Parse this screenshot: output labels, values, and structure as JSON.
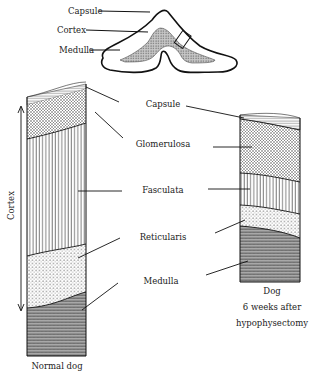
{
  "inset": {
    "labels": {
      "capsule": "Capsule",
      "cortex": "Cortex",
      "medulla": "Medulla"
    }
  },
  "layers": {
    "capsule": "Capsule",
    "glomerulosa": "Glomerulosa",
    "fasculata": "Fasculata",
    "reticularis": "Reticularis",
    "medulla": "Medulla"
  },
  "left_column": {
    "caption": "Normal dog",
    "axis_label": "Cortex"
  },
  "right_column": {
    "caption_line1": "Dog",
    "caption_line2": "6 weeks after",
    "caption_line3": "hypophysectomy"
  },
  "colors": {
    "ink": "#1a1a1a",
    "medulla_fill": "#9a9a9a",
    "background": "#ffffff"
  }
}
